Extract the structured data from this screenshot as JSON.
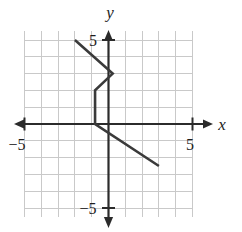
{
  "figure": {
    "type": "coordinate-plane-graph",
    "background_color": "#ffffff",
    "grid_color": "#c9c9c9",
    "axis_color": "#2b2b2b",
    "curve_color": "#3a3a3a"
  },
  "axes": {
    "x_label": "x",
    "y_label": "y",
    "x_tick_labels": [
      {
        "text": "−5",
        "value": -5
      },
      {
        "text": "5",
        "value": 5
      }
    ],
    "y_tick_labels": [
      {
        "text": "5",
        "value": 5
      },
      {
        "text": "−5",
        "value": -5
      }
    ]
  },
  "chart_data": {
    "type": "line",
    "title": "",
    "xlabel": "x",
    "ylabel": "y",
    "xlim": [
      -5,
      5
    ],
    "ylim": [
      -5,
      5
    ],
    "xticks": [
      -5,
      5
    ],
    "yticks": [
      -5,
      5
    ],
    "grid": true,
    "grid_spacing": 1,
    "legend": "none",
    "series": [
      {
        "name": "piecewise-zigzag",
        "points": [
          {
            "x": -2.0,
            "y": 5.0
          },
          {
            "x": 0.25,
            "y": 3.0
          },
          {
            "x": -0.8,
            "y": 2.0
          },
          {
            "x": -0.8,
            "y": 0.0
          },
          {
            "x": 3.0,
            "y": -2.5
          }
        ]
      }
    ]
  }
}
